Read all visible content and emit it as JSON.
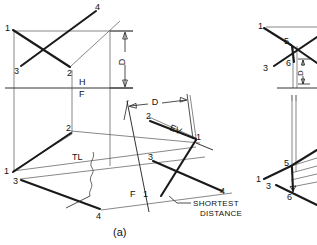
{
  "figure": {
    "caption": "(a)",
    "title_note": "Descriptive geometry construction - shortest distance between two skew lines"
  },
  "labels": {
    "point_1": "1",
    "point_2": "2",
    "point_3": "3",
    "point_4": "4",
    "point_5": "5",
    "point_6": "6",
    "dim_D": "D",
    "fold_H": "H",
    "fold_F": "F",
    "fold_F2": "F",
    "fold_1": "1",
    "true_length": "TL",
    "edge_view": "EV",
    "shortest_line_1": "SHORTEST",
    "shortest_line_2": "DISTANCE"
  },
  "left_figure": {
    "top_view_points": [
      {
        "name": "1",
        "x": 10,
        "y": 29
      },
      {
        "name": "3",
        "x": 19,
        "y": 68
      },
      {
        "name": "4",
        "x": 98,
        "y": 8
      },
      {
        "name": "2",
        "x": 71,
        "y": 67
      }
    ],
    "front_view_points": [
      {
        "name": "2",
        "x": 70,
        "y": 132
      },
      {
        "name": "1",
        "x": 12,
        "y": 170
      },
      {
        "name": "3",
        "x": 19,
        "y": 179
      },
      {
        "name": "4",
        "x": 101,
        "y": 210
      }
    ],
    "aux_view_points": [
      {
        "name": "2",
        "x": 150,
        "y": 119
      },
      {
        "name": "1",
        "x": 197,
        "y": 139
      },
      {
        "name": "3",
        "x": 151,
        "y": 159
      },
      {
        "name": "4",
        "x": 223,
        "y": 192
      }
    ],
    "fold_line_HF_y": 88,
    "dimension_D_vertical": {
      "top_y": 31,
      "bottom_y": 88,
      "x": 125
    },
    "dimension_D_horizontal": {
      "left_x": 128,
      "right_x": 187,
      "y": 104
    }
  },
  "right_figure": {
    "top_view_points": [
      {
        "name": "1",
        "x": 262,
        "y": 27
      },
      {
        "name": "5",
        "x": 289,
        "y": 42
      },
      {
        "name": "3",
        "x": 270,
        "y": 66
      },
      {
        "name": "6",
        "x": 291,
        "y": 62
      }
    ],
    "front_view_points": [
      {
        "name": "5",
        "x": 289,
        "y": 166
      },
      {
        "name": "1",
        "x": 262,
        "y": 178
      },
      {
        "name": "3",
        "x": 272,
        "y": 185
      },
      {
        "name": "6",
        "x": 291,
        "y": 194
      }
    ],
    "fold_line_HF_y": 88,
    "dimension_D_vertical": {
      "top_y": 59,
      "bottom_y": 84,
      "x": 303
    }
  },
  "colors": {
    "ink": "#1a1a1a",
    "light_line": "#555555",
    "background": "#ffffff"
  }
}
